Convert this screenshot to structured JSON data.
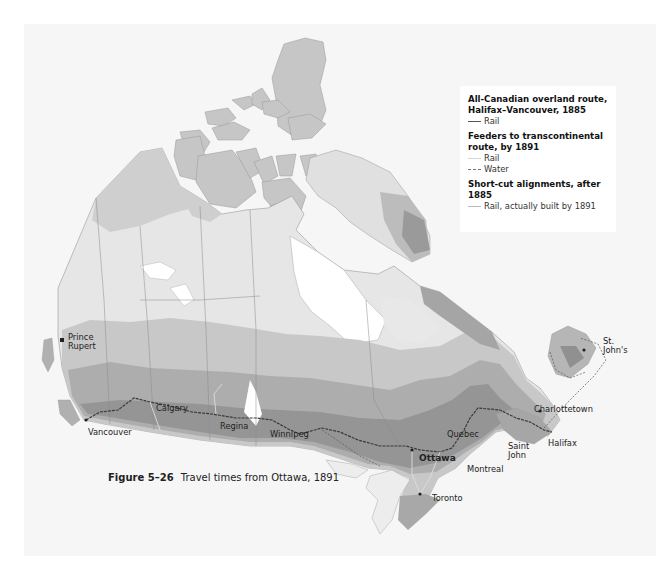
{
  "figure": {
    "number": "Figure 5–26",
    "title": "Travel times from Ottawa, 1891"
  },
  "legend": {
    "groups": [
      {
        "heading": "All-Canadian overland route, Halifax–Vancouver, 1885",
        "heading_line1": "All-Canadian overland route,",
        "heading_line2": "Halifax–Vancouver, 1885",
        "items": [
          {
            "symbol": "rail-main",
            "label": "Rail"
          }
        ]
      },
      {
        "heading": "Feeders to transcontinental route, by 1891",
        "heading_line1": "Feeders to transcontinental",
        "heading_line2": "route, by 1891",
        "items": [
          {
            "symbol": "rail-feeder",
            "label": "Rail"
          },
          {
            "symbol": "water",
            "label": "Water"
          }
        ]
      },
      {
        "heading": "Short-cut alignments, after 1885",
        "heading_line1": "Short-cut alignments, after 1885",
        "items": [
          {
            "symbol": "shortcut",
            "label": "Rail, actually built by 1891"
          }
        ]
      }
    ]
  },
  "cities": [
    {
      "name": "Prince",
      "name2": "Rupert",
      "x": 68,
      "y": 338
    },
    {
      "name": "Vancouver",
      "x": 88,
      "y": 427
    },
    {
      "name": "Calgary",
      "x": 156,
      "y": 408
    },
    {
      "name": "Regina",
      "x": 220,
      "y": 424
    },
    {
      "name": "Winnipeg",
      "x": 270,
      "y": 431
    },
    {
      "name": "Ottawa",
      "x": 419,
      "y": 456,
      "bold": true
    },
    {
      "name": "Montreal",
      "x": 467,
      "y": 465
    },
    {
      "name": "Quebec",
      "x": 447,
      "y": 428
    },
    {
      "name": "Toronto",
      "x": 432,
      "y": 496
    },
    {
      "name": "Saint",
      "name2": "John",
      "x": 508,
      "y": 444
    },
    {
      "name": "Halifax",
      "x": 548,
      "y": 441
    },
    {
      "name": "Charlottetown",
      "x": 534,
      "y": 403
    },
    {
      "name": "St.",
      "name2": "John's",
      "x": 603,
      "y": 337
    }
  ],
  "colors": {
    "background_panel": "#f6f6f6",
    "zone_1": "#e8e8e8",
    "zone_2": "#cfcfcf",
    "zone_3": "#b8b8b8",
    "zone_4": "#a2a2a2",
    "zone_5": "#8c8c8c",
    "rail_main": "#3a3a3a",
    "water": "#d6d6d6"
  }
}
